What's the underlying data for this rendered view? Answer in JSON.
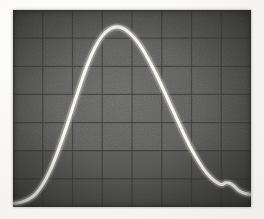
{
  "image": {
    "kind": "oscilloscope-screen-photograph",
    "caption": "",
    "medium": "black-and-white photograph of a cathode ray tube display",
    "screen": {
      "background_color": "#5d5d5d",
      "grid_line_color": "#3c3c3a",
      "trace_color": "#f6f5ef",
      "border_color": "#f7f6f3"
    }
  },
  "chart_data": {
    "type": "line",
    "title": "",
    "subtitle": "",
    "xlabel": "",
    "ylabel": "",
    "legend": [],
    "annotations": [],
    "grid": true,
    "grid_divisions_x": 8,
    "grid_divisions_y": 7,
    "xlim": [
      0,
      8
    ],
    "ylim": [
      0,
      7
    ],
    "tick_labels_x": [],
    "tick_labels_y": [],
    "series": [
      {
        "name": "trace",
        "description": "bell-shaped pulse rising from a low baseline at the left, peaking just below the top of the screen slightly left of centre, then falling with a small shoulder near the lower right before leaving the screen",
        "x": [
          0.0,
          0.25,
          0.5,
          0.75,
          1.0,
          1.25,
          1.5,
          1.75,
          2.0,
          2.25,
          2.5,
          2.75,
          3.0,
          3.25,
          3.5,
          3.75,
          4.0,
          4.25,
          4.5,
          4.75,
          5.0,
          5.25,
          5.5,
          5.75,
          6.0,
          6.25,
          6.5,
          6.75,
          7.0,
          7.15,
          7.3,
          7.45,
          7.6,
          7.8,
          8.0
        ],
        "y": [
          0.12,
          0.16,
          0.26,
          0.45,
          0.8,
          1.3,
          1.95,
          2.7,
          3.5,
          4.3,
          5.05,
          5.65,
          6.08,
          6.32,
          6.4,
          6.32,
          6.1,
          5.78,
          5.35,
          4.85,
          4.3,
          3.72,
          3.15,
          2.58,
          2.05,
          1.6,
          1.22,
          0.95,
          0.8,
          0.86,
          0.84,
          0.72,
          0.58,
          0.48,
          0.45
        ]
      }
    ]
  }
}
